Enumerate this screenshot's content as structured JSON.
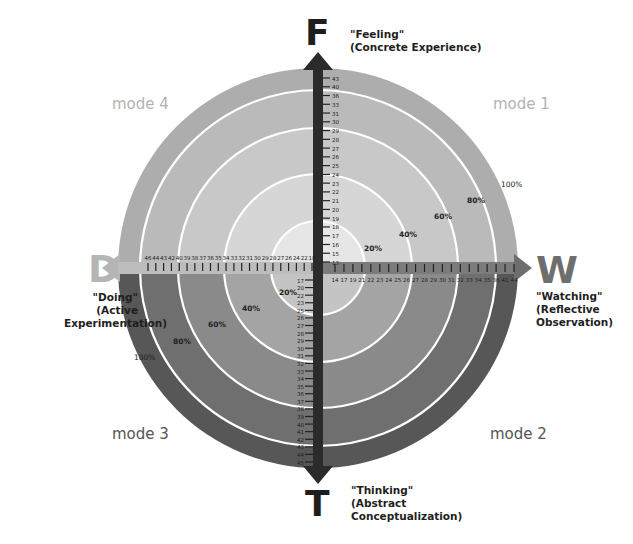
{
  "colors": {
    "top_rings": [
      "#e6e6e6",
      "#d6d6d6",
      "#c8c8c8",
      "#bababa",
      "#adadad"
    ],
    "bottom_rings": [
      "#c4c4c4",
      "#a4a4a4",
      "#8a8a8a",
      "#6f6f6f",
      "#575757"
    ],
    "ring_line": "#ffffff",
    "axis_dark": "#2b2b2b",
    "axis_gray": "#6e6e6e",
    "letter_dark": "#1e1e1e",
    "letter_light": "#b5b5b5",
    "mode_top": "#b3b3b3",
    "mode_bottom": "#555555"
  },
  "poles": {
    "top": {
      "letter": "F",
      "label_line1": "\"Feeling\"",
      "label_line2": "(Concrete Experience)"
    },
    "bottom": {
      "letter": "T",
      "label_line1": "\"Thinking\"",
      "label_line2": "(Abstract",
      "label_line3": "Conceptualization)"
    },
    "left": {
      "letter": "D",
      "label_line1": "\"Doing\"",
      "label_line2": "(Active",
      "label_line3": "Experimentation)"
    },
    "right": {
      "letter": "W",
      "label_line1": "\"Watching\"",
      "label_line2": "(Reflective",
      "label_line3": "Observation)"
    }
  },
  "modes": {
    "mode1": "mode 1",
    "mode2": "mode 2",
    "mode3": "mode 3",
    "mode4": "mode 4"
  },
  "percent_labels": {
    "upper_right": [
      "20%",
      "40%",
      "60%",
      "80%",
      "100%"
    ],
    "lower_left": [
      "20%",
      "40%",
      "60%",
      "80%",
      "100%"
    ]
  },
  "chart_data": {
    "type": "radial-quadrant-diagram",
    "title": "",
    "rings_percent": [
      20,
      40,
      60,
      80,
      100
    ],
    "axes": {
      "vertical": {
        "top": "F",
        "bottom": "T"
      },
      "horizontal": {
        "left": "D",
        "right": "W"
      }
    },
    "scales": {
      "up_F": [
        13,
        15,
        16,
        17,
        18,
        19,
        20,
        21,
        22,
        23,
        24,
        25,
        26,
        27,
        28,
        29,
        30,
        31,
        33,
        36,
        40,
        43
      ],
      "down_T": [
        17,
        20,
        22,
        23,
        25,
        26,
        27,
        28,
        29,
        30,
        31,
        32,
        33,
        34,
        35,
        36,
        37,
        38,
        39,
        40,
        41,
        42,
        43,
        44,
        45
      ],
      "left_D": [
        18,
        22,
        24,
        26,
        27,
        28,
        29,
        30,
        31,
        32,
        33,
        34,
        35,
        36,
        37,
        38,
        39,
        40,
        42,
        43,
        44,
        46
      ],
      "right_W": [
        14,
        17,
        19,
        21,
        22,
        23,
        24,
        25,
        26,
        27,
        28,
        29,
        30,
        31,
        32,
        33,
        34,
        35,
        36,
        41,
        44
      ]
    },
    "quadrants": [
      "mode 1",
      "mode 2",
      "mode 3",
      "mode 4"
    ]
  }
}
